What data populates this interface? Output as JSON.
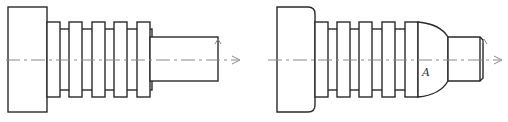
{
  "figures": [
    {
      "id": "left",
      "description": "Stepped shaft with four fins and cylindrical end",
      "label": ""
    },
    {
      "id": "right",
      "description": "Stepped shaft with four fins, domed transition and chamfered end",
      "label": "A"
    }
  ],
  "colors": {
    "stroke": "#2a2a2a",
    "axis": "#8a8a8a",
    "background": "#ffffff"
  }
}
